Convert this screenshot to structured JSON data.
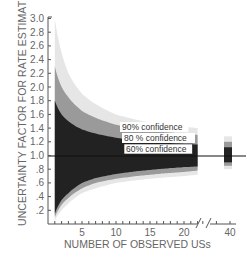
{
  "chart_data": {
    "type": "area",
    "title": "",
    "xlabel": "NUMBER OF OBSERVED USs",
    "ylabel": "UNCERTAINTY FACTOR FOR RATE ESTIMATE",
    "ylim": [
      0,
      3.0
    ],
    "xlim": [
      0,
      40
    ],
    "x_axis_break": [
      22,
      38
    ],
    "grid": false,
    "legend_position": "inline labels near x=10-20",
    "y_ticks": [
      "3.0",
      "2.8",
      "2.6",
      "2.4",
      "2.2",
      "2.0",
      "1.8",
      "1.6",
      "1.4",
      "1.2",
      "1.0",
      ".8",
      ".6",
      ".4",
      ".2"
    ],
    "x_ticks": [
      "5",
      "10",
      "15",
      "20",
      "40"
    ],
    "reference_line": {
      "y": 1.0,
      "label": ""
    },
    "x": [
      1,
      2,
      3,
      5,
      7,
      10,
      15,
      20,
      22,
      40
    ],
    "series": [
      {
        "name": "90% confidence",
        "color": "#e6e6e6",
        "upper": [
          3.0,
          2.5,
          2.2,
          1.9,
          1.75,
          1.6,
          1.48,
          1.42,
          1.4,
          1.28
        ],
        "lower": [
          0.05,
          0.2,
          0.3,
          0.45,
          0.52,
          0.6,
          0.66,
          0.7,
          0.72,
          0.8
        ]
      },
      {
        "name": "80 % confidence",
        "color": "#9a9a9a",
        "upper": [
          2.3,
          2.0,
          1.85,
          1.65,
          1.55,
          1.45,
          1.36,
          1.32,
          1.3,
          1.2
        ],
        "lower": [
          0.1,
          0.28,
          0.38,
          0.52,
          0.6,
          0.66,
          0.72,
          0.76,
          0.78,
          0.85
        ]
      },
      {
        "name": "60% confidence",
        "color": "#222222",
        "upper": [
          1.8,
          1.6,
          1.5,
          1.38,
          1.32,
          1.26,
          1.2,
          1.17,
          1.16,
          1.12
        ],
        "lower": [
          0.15,
          0.35,
          0.45,
          0.6,
          0.67,
          0.73,
          0.79,
          0.83,
          0.84,
          0.9
        ]
      }
    ],
    "annotations": [
      "90% confidence",
      "80 % confidence",
      "60% confidence"
    ]
  },
  "colors": {
    "band90": "#e6e6e6",
    "band80": "#9a9a9a",
    "band60": "#222222",
    "axis": "#555555",
    "text": "#555555"
  }
}
